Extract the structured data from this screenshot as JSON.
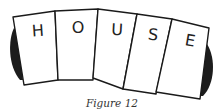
{
  "figure": {
    "caption": "Figure 12",
    "cards": [
      {
        "letter": "H"
      },
      {
        "letter": "O"
      },
      {
        "letter": "U"
      },
      {
        "letter": "S"
      },
      {
        "letter": "E"
      }
    ],
    "colors": {
      "card_fill": "#ffffff",
      "outline": "#1a1a1a",
      "shadow": "#1c1c1c"
    }
  }
}
